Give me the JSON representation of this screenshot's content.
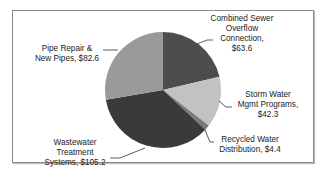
{
  "chart_data": {
    "type": "pie",
    "title": "",
    "start_angle_deg": 0,
    "direction": "clockwise",
    "categories": [
      "Combined Sewer Overflow Connection",
      "Storm Water Mgmt Programs",
      "Recycled Water Distribution",
      "Wastewater Treatment Systems",
      "Pipe Repair & New Pipes"
    ],
    "values": [
      63.6,
      42.3,
      4.4,
      105.2,
      82.6
    ],
    "colors": [
      "#4d4d4d",
      "#c2c2c2",
      "#7a7a7a",
      "#3a3a3a",
      "#9a9a9a"
    ],
    "value_prefix": "$",
    "legend": "none",
    "labels": [
      {
        "lines": [
          "Combined Sewer",
          "Overflow",
          "Connection,",
          "$63.6"
        ]
      },
      {
        "lines": [
          "Storm Water",
          "Mgmt Programs,",
          "$42.3"
        ]
      },
      {
        "lines": [
          "Recycled Water",
          "Distribution,  $4.4"
        ]
      },
      {
        "lines": [
          "Wastewater",
          "Treatment",
          "Systems,  $105.2"
        ]
      },
      {
        "lines": [
          "Pipe Repair &",
          "New Pipes,  $82.6"
        ]
      }
    ]
  }
}
